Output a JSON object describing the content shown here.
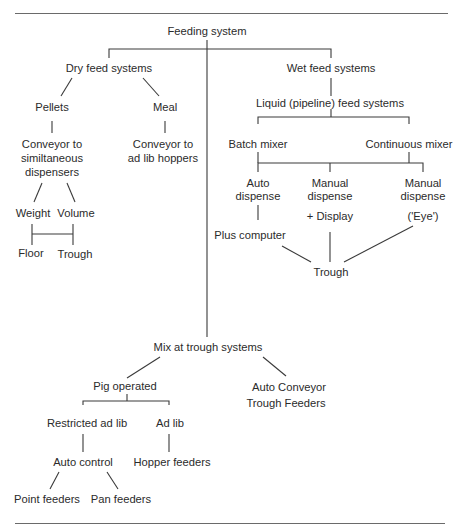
{
  "diagram": {
    "root": "Feeding system",
    "dry": {
      "title": "Dry feed systems",
      "pellets": "Pellets",
      "meal": "Meal",
      "conveyor_sim_1": "Conveyor to",
      "conveyor_sim_2": "similtaneous",
      "conveyor_sim_3": "dispensers",
      "conveyor_adlib_1": "Conveyor to",
      "conveyor_adlib_2": "ad lib hoppers",
      "weight": "Weight",
      "volume": "Volume",
      "floor": "Floor",
      "trough": "Trough"
    },
    "wet": {
      "title": "Wet feed systems",
      "liquid": "Liquid (pipeline) feed systems",
      "batch": "Batch mixer",
      "continuous": "Continuous mixer",
      "auto_dispense_1": "Auto",
      "auto_dispense_2": "dispense",
      "manual_dispense_1": "Manual",
      "manual_dispense_2": "dispense",
      "manual_dispense_eye_1": "Manual",
      "manual_dispense_eye_2": "dispense",
      "plus_computer": "Plus computer",
      "plus_display": "+ Display",
      "eye": "('Eye')",
      "trough": "Trough"
    },
    "mix": {
      "title": "Mix at  trough systems",
      "pig_operated": "Pig operated",
      "auto_conveyor_1": "Auto Conveyor",
      "auto_conveyor_2": "Trough  Feeders",
      "restricted": "Restricted ad lib",
      "adlib": "Ad lib",
      "auto_control": "Auto control",
      "hopper_feeders": "Hopper feeders",
      "point_feeders": "Point feeders",
      "pan_feeders": "Pan feeders"
    }
  }
}
